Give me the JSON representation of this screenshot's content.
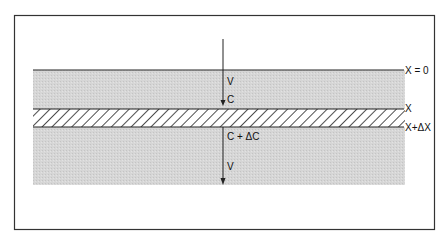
{
  "diagram": {
    "type": "layer-flow-schematic",
    "colors": {
      "border": "#333333",
      "fill": "#d4d4d4",
      "hatch": "#222222",
      "line": "#222222",
      "background": "#ffffff"
    },
    "boundaries": {
      "top": "X = 0",
      "slab_top": "X",
      "slab_bottom": "X+ΔX"
    },
    "flow_labels": {
      "velocity_in": "V",
      "concentration_in": "C",
      "concentration_out": "C + ΔC",
      "velocity_out": "V"
    }
  }
}
